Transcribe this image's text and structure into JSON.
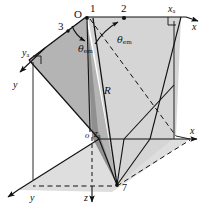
{
  "figure": {
    "type": "line-diagram",
    "background": "#ffffff",
    "ink_color": "#111111",
    "fill_light": "#dcdcdc",
    "fill_mid": "#c6c6c6",
    "fill_dark": "#9a9a9a"
  },
  "labels": {
    "origin": "O",
    "point1": "1",
    "point2": "2",
    "point3": "3",
    "vertex_bottom": "7",
    "radius": "R",
    "theta_left": "θ",
    "theta_left_sub": "em",
    "theta_right": "θ",
    "theta_right_sub": "em",
    "axis_x_top": "x",
    "axis_x_mid": "x",
    "axis_xa": "x",
    "axis_xa_sub": "a",
    "axis_y": "y",
    "axis_ya": "y",
    "axis_ya_sub": "a",
    "axis_z": "z",
    "axis_za": "z",
    "axis_za_sub": "a",
    "origin_lower": "o"
  },
  "geometry": {
    "points": {
      "O": [
        86,
        17
      ],
      "P1": [
        93,
        18
      ],
      "P2": [
        124,
        18
      ],
      "P3": [
        68,
        30
      ],
      "XA": [
        181,
        16
      ],
      "YA": [
        28,
        59
      ],
      "XM": [
        176,
        136
      ],
      "VB": [
        117,
        185
      ],
      "OL": [
        92,
        137
      ]
    },
    "axis_arrows": {
      "x_top_end": [
        199,
        22
      ],
      "x_mid_end": [
        197,
        138
      ],
      "y_end": [
        15,
        196
      ],
      "z_end": [
        93,
        203
      ]
    }
  }
}
